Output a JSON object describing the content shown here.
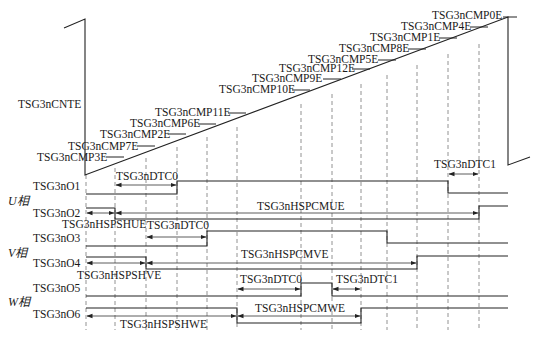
{
  "diagram": {
    "counter": {
      "label": "TSG3nCNTE",
      "compare_events": [
        {
          "label": "TSG3nCMP3E",
          "x": 115
        },
        {
          "label": "TSG3nCMP7E",
          "x": 146
        },
        {
          "label": "TSG3nCMP2E",
          "x": 177
        },
        {
          "label": "TSG3nCMP6E",
          "x": 207
        },
        {
          "label": "TSG3nCMP11E",
          "x": 237
        },
        {
          "label": "TSG3nCMP10E",
          "x": 301
        },
        {
          "label": "TSG3nCMP9E",
          "x": 332
        },
        {
          "label": "TSG3nCMP12E",
          "x": 361
        },
        {
          "label": "TSG3nCMP5E",
          "x": 387
        },
        {
          "label": "TSG3nCMP8E",
          "x": 417
        },
        {
          "label": "TSG3nCMP1E",
          "x": 448
        },
        {
          "label": "TSG3nCMP4E",
          "x": 479
        },
        {
          "label": "TSG3nCMP0E",
          "x": 508
        }
      ]
    },
    "phases": {
      "u": "U相",
      "v": "V相",
      "w": "W相"
    },
    "signals": {
      "o1": "TSG3nO1",
      "o2": "TSG3nO2",
      "o3": "TSG3nO3",
      "o4": "TSG3nO4",
      "o5": "TSG3nO5",
      "o6": "TSG3nO6"
    },
    "intervals": {
      "dtc0_u": "TSG3nDTC0",
      "dtc1_u": "TSG3nDTC1",
      "hspshue": "TSG3nHSPSHUE",
      "hspcmue": "TSG3nHSPCMUE",
      "dtc0_v": "TSG3nDTC0",
      "hspshve": "TSG3nHSPSHVE",
      "hspcmve": "TSG3nHSPCMVE",
      "dtc0_w": "TSG3nDTC0",
      "dtc1_w": "TSG3nDTC1",
      "hspshwe": "TSG3nHSPSHWE",
      "hspcmwe": "TSG3nHSPCMWE"
    },
    "colors": {
      "line": "#222222",
      "dash": "#777777",
      "background": "#ffffff"
    }
  }
}
